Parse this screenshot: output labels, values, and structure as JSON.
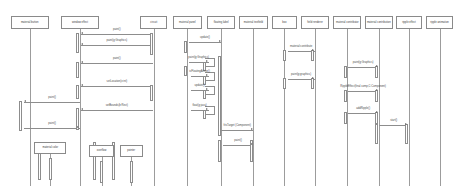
{
  "diagram": {
    "type": "uml-sequence-diagram",
    "canvas": {
      "width": 453,
      "height": 190
    },
    "background": "#ffffff",
    "line_color": "#8d8d8d",
    "text_color": "#3a3a3a"
  },
  "lifelines": [
    {
      "id": "ll0",
      "label": "material button",
      "x": 12,
      "w": 42,
      "y": 16,
      "h": 13,
      "stem_top": 29,
      "stem_bottom": 186
    },
    {
      "id": "ll1",
      "label": "window effect",
      "x": 68,
      "w": 42,
      "y": 16,
      "h": 13,
      "stem_top": 29,
      "stem_bottom": 186
    },
    {
      "id": "ll2",
      "label": "circuit",
      "x": 156,
      "w": 30,
      "y": 16,
      "h": 13,
      "stem_top": 29,
      "stem_bottom": 186
    },
    {
      "id": "ll3",
      "label": "material panel",
      "x": 192,
      "w": 33,
      "y": 16,
      "h": 13,
      "stem_top": 29,
      "stem_bottom": 186
    },
    {
      "id": "ll4",
      "label": "floating label",
      "x": 230,
      "w": 32,
      "y": 16,
      "h": 13,
      "stem_top": 29,
      "stem_bottom": 186
    },
    {
      "id": "ll5",
      "label": "material textfield",
      "x": 266,
      "w": 32,
      "y": 16,
      "h": 13,
      "stem_top": 29,
      "stem_bottom": 186
    },
    {
      "id": "ll6",
      "label": "box",
      "x": 303,
      "w": 27,
      "y": 16,
      "h": 13,
      "stem_top": 29,
      "stem_bottom": 186
    },
    {
      "id": "ll7",
      "label": "field renderer",
      "x": 335,
      "w": 31,
      "y": 16,
      "h": 13,
      "stem_top": 29,
      "stem_bottom": 186
    },
    {
      "id": "ll8",
      "label": "material contributor",
      "x": 371,
      "w": 31,
      "y": 16,
      "h": 13,
      "stem_top": 29,
      "stem_bottom": 186
    },
    {
      "id": "ll9",
      "label": "material contribution",
      "x": 406,
      "w": 31,
      "y": 16,
      "h": 13,
      "stem_top": 29,
      "stem_bottom": 186
    },
    {
      "id": "ll10",
      "label": "ripple effect",
      "x": 441,
      "w": 28,
      "y": 16,
      "h": 13,
      "stem_top": 29,
      "stem_bottom": 186
    },
    {
      "id": "ll11",
      "label": "ripple animation",
      "x": 474,
      "w": 30,
      "y": 16,
      "h": 13,
      "stem_top": 29,
      "stem_bottom": 186
    }
  ],
  "activations": [
    {
      "id": "a0",
      "x": 86,
      "y": 33,
      "h": 20
    },
    {
      "id": "a1",
      "x": 86,
      "y": 62,
      "h": 16
    },
    {
      "id": "a2",
      "x": 86,
      "y": 85,
      "h": 14
    },
    {
      "id": "a3",
      "x": 86,
      "y": 108,
      "h": 22
    },
    {
      "id": "a4",
      "x": 23,
      "y": 101,
      "h": 30
    },
    {
      "id": "a5",
      "x": 44,
      "y": 142,
      "h": 38
    },
    {
      "id": "a6",
      "x": 105,
      "y": 142,
      "h": 38
    },
    {
      "id": "a7",
      "x": 126,
      "y": 142,
      "h": 38
    },
    {
      "id": "a8",
      "x": 169,
      "y": 33,
      "h": 22
    },
    {
      "id": "a9",
      "x": 169,
      "y": 85,
      "h": 16
    },
    {
      "id": "a10",
      "x": 206,
      "y": 41,
      "h": 12
    },
    {
      "id": "a11",
      "x": 206,
      "y": 66,
      "h": 10
    },
    {
      "id": "a12",
      "x": 244,
      "y": 56,
      "h": 80
    },
    {
      "id": "a13",
      "x": 228,
      "y": 62,
      "h": 9
    },
    {
      "id": "a14",
      "x": 228,
      "y": 76,
      "h": 9
    },
    {
      "id": "a15",
      "x": 228,
      "y": 90,
      "h": 9
    },
    {
      "id": "a16",
      "x": 228,
      "y": 110,
      "h": 9
    },
    {
      "id": "a17",
      "x": 244,
      "y": 140,
      "h": 22
    },
    {
      "id": "a18",
      "x": 280,
      "y": 140,
      "h": 22
    },
    {
      "id": "a19",
      "x": 317,
      "y": 50,
      "h": 11
    },
    {
      "id": "a20",
      "x": 317,
      "y": 78,
      "h": 11
    },
    {
      "id": "a21",
      "x": 348,
      "y": 50,
      "h": 11
    },
    {
      "id": "a22",
      "x": 348,
      "y": 78,
      "h": 11
    },
    {
      "id": "a23",
      "x": 384,
      "y": 66,
      "h": 12
    },
    {
      "id": "a24",
      "x": 384,
      "y": 90,
      "h": 12
    },
    {
      "id": "a25",
      "x": 384,
      "y": 112,
      "h": 12
    },
    {
      "id": "a26",
      "x": 419,
      "y": 66,
      "h": 12
    },
    {
      "id": "a27",
      "x": 419,
      "y": 90,
      "h": 12
    },
    {
      "id": "a28",
      "x": 419,
      "y": 112,
      "h": 12
    },
    {
      "id": "a29",
      "x": 419,
      "y": 124,
      "h": 20
    },
    {
      "id": "a30",
      "x": 452,
      "y": 124,
      "h": 20
    }
  ],
  "messages": [
    {
      "id": "m0",
      "label": "paint()",
      "x1": 90,
      "x2": 170,
      "y": 34,
      "dir": "left"
    },
    {
      "id": "m1",
      "label": "paint(g:Graphics)",
      "x1": 90,
      "x2": 170,
      "y": 45,
      "dir": "left"
    },
    {
      "id": "m2",
      "label": "paint()",
      "x1": 90,
      "x2": 170,
      "y": 63,
      "dir": "left"
    },
    {
      "id": "m3",
      "label": "setLocation(x:int)",
      "x1": 90,
      "x2": 170,
      "y": 86,
      "dir": "left"
    },
    {
      "id": "m4",
      "label": "setBounds(b:Rect)",
      "x1": 90,
      "x2": 170,
      "y": 110,
      "dir": "left"
    },
    {
      "id": "m5",
      "label": "paint()",
      "x1": 27,
      "x2": 89,
      "y": 102,
      "dir": "left"
    },
    {
      "id": "m6",
      "label": "paint()",
      "x1": 27,
      "x2": 89,
      "y": 128,
      "dir": "right"
    },
    {
      "id": "m7",
      "label": "update()",
      "x1": 210,
      "x2": 246,
      "y": 42,
      "dir": "right"
    },
    {
      "id": "m8",
      "label": "paint(g:Graphics)",
      "x1": 210,
      "x2": 232,
      "y": 62,
      "dir": "right"
    },
    {
      "id": "m9",
      "label": "isFloatingActive()",
      "x1": 212,
      "x2": 232,
      "y": 76,
      "dir": "right"
    },
    {
      "id": "m10",
      "label": "update()",
      "x1": 212,
      "x2": 232,
      "y": 90,
      "dir": "right"
    },
    {
      "id": "m11",
      "label": "float(g:java)",
      "x1": 212,
      "x2": 232,
      "y": 110,
      "dir": "right"
    },
    {
      "id": "m12",
      "label": "fitsTarget (Component)",
      "x1": 246,
      "x2": 282,
      "y": 130,
      "dir": "right"
    },
    {
      "id": "m13",
      "label": "paint()",
      "x1": 248,
      "x2": 282,
      "y": 145,
      "dir": "right"
    },
    {
      "id": "m14",
      "label": "material:contribute",
      "x1": 320,
      "x2": 350,
      "y": 51,
      "dir": "right"
    },
    {
      "id": "m15",
      "label": "paint(g:graphics)",
      "x1": 320,
      "x2": 350,
      "y": 79,
      "dir": "right"
    },
    {
      "id": "m16",
      "label": "paint(g:Graphics)",
      "x1": 387,
      "x2": 421,
      "y": 67,
      "dir": "right"
    },
    {
      "id": "m17",
      "label": "RippleEffect(final comp,C:Component)",
      "x1": 387,
      "x2": 421,
      "y": 91,
      "dir": "right"
    },
    {
      "id": "m18",
      "label": "addRipple()",
      "x1": 387,
      "x2": 421,
      "y": 113,
      "dir": "right"
    },
    {
      "id": "m19",
      "label": "start()",
      "x1": 422,
      "x2": 454,
      "y": 125,
      "dir": "right"
    }
  ],
  "self_messages": [
    {
      "id": "s0",
      "x": 228,
      "y": 58,
      "w": 11,
      "h": 9
    },
    {
      "id": "s1",
      "x": 228,
      "y": 72,
      "w": 11,
      "h": 9
    },
    {
      "id": "s2",
      "x": 228,
      "y": 86,
      "w": 11,
      "h": 9
    },
    {
      "id": "s3",
      "x": 228,
      "y": 106,
      "w": 11,
      "h": 9
    }
  ],
  "created_objects": [
    {
      "id": "c0",
      "label": "material color",
      "x": 38,
      "y": 142,
      "w": 36,
      "h": 12,
      "stem_x": 56,
      "stem_top": 154,
      "stem_bottom": 186
    },
    {
      "id": "c1",
      "label": "overflow",
      "x": 99,
      "y": 145,
      "w": 28,
      "h": 12,
      "stem_x": 113,
      "stem_top": 157,
      "stem_bottom": 186
    },
    {
      "id": "c2",
      "label": "pointer",
      "x": 133,
      "y": 145,
      "w": 26,
      "h": 12,
      "stem_x": 146,
      "stem_top": 157,
      "stem_bottom": 186
    }
  ]
}
